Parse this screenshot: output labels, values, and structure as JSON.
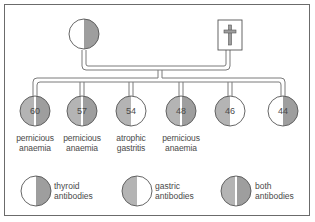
{
  "colors": {
    "frame": "#6b6b6b",
    "line": "#7a7a7a",
    "thyroid_fill": "#9e9e9e",
    "gastric_fill": "#b4b4b4",
    "blank_fill": "#ffffff",
    "text": "#4a4a4a"
  },
  "parents": [
    {
      "type": "circle",
      "sex": "female",
      "status": "alive",
      "left_fill": "none",
      "right_fill": "thyroid"
    },
    {
      "type": "square",
      "sex": "male",
      "status": "deceased",
      "icon": "cross-icon"
    }
  ],
  "children": [
    {
      "age": "60",
      "left": "gastric",
      "right": "thyroid",
      "condition_line1": "pernicious",
      "condition_line2": "anaemia"
    },
    {
      "age": "57",
      "left": "gastric",
      "right": "thyroid",
      "condition_line1": "pernicious",
      "condition_line2": "anaemia"
    },
    {
      "age": "54",
      "left": "gastric",
      "right": "none",
      "condition_line1": "atrophic",
      "condition_line2": "gastritis"
    },
    {
      "age": "48",
      "left": "gastric",
      "right": "thyroid",
      "condition_line1": "pernicious",
      "condition_line2": "anaemia"
    },
    {
      "age": "46",
      "left": "gastric",
      "right": "none",
      "condition_line1": "",
      "condition_line2": ""
    },
    {
      "age": "44",
      "left": "none",
      "right": "thyroid",
      "condition_line1": "",
      "condition_line2": ""
    }
  ],
  "legend": [
    {
      "line1": "thyroid",
      "line2": "antibodies",
      "left": "none",
      "right": "thyroid"
    },
    {
      "line1": "gastric",
      "line2": "antibodies",
      "left": "gastric",
      "right": "none"
    },
    {
      "line1": "both",
      "line2": "antibodies",
      "left": "gastric",
      "right": "thyroid"
    }
  ]
}
